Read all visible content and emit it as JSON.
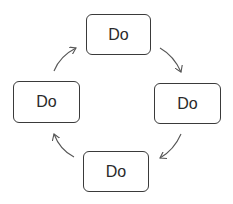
{
  "diagram": {
    "type": "cycle",
    "colors": {
      "stroke": "#3a3a3a",
      "text": "#2a2a2a",
      "arrow": "#555555",
      "background": "#ffffff"
    },
    "nodes": [
      {
        "id": "top",
        "label": "Do",
        "x": 86,
        "y": 14,
        "w": 65,
        "h": 41
      },
      {
        "id": "right",
        "label": "Do",
        "x": 154,
        "y": 83,
        "w": 67,
        "h": 41
      },
      {
        "id": "bottom",
        "label": "Do",
        "x": 83,
        "y": 151,
        "w": 66,
        "h": 41
      },
      {
        "id": "left",
        "label": "Do",
        "x": 13,
        "y": 81,
        "w": 67,
        "h": 42
      }
    ],
    "edges": [
      {
        "from": "top",
        "to": "right",
        "direction": "clockwise"
      },
      {
        "from": "right",
        "to": "bottom",
        "direction": "clockwise"
      },
      {
        "from": "bottom",
        "to": "left",
        "direction": "clockwise"
      },
      {
        "from": "left",
        "to": "top",
        "direction": "clockwise"
      }
    ]
  }
}
